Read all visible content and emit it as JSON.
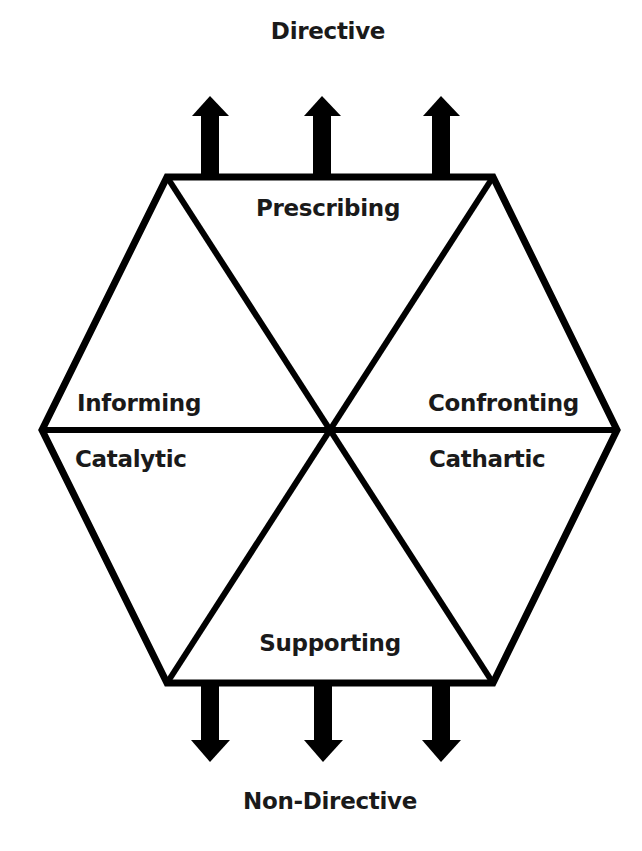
{
  "diagram": {
    "title_top": "Directive",
    "title_bottom": "Non-Directive",
    "segments": [
      {
        "id": "prescribing",
        "label": "Prescribing"
      },
      {
        "id": "informing",
        "label": "Informing"
      },
      {
        "id": "confronting",
        "label": "Confronting"
      },
      {
        "id": "catalytic",
        "label": "Catalytic"
      },
      {
        "id": "cathartic",
        "label": "Cathartic"
      },
      {
        "id": "supporting",
        "label": "Supporting"
      }
    ],
    "arrows_top": {
      "count": 3,
      "direction": "up"
    },
    "arrows_bottom": {
      "count": 3,
      "direction": "down"
    },
    "colors": {
      "stroke": "#000000",
      "text": "#1a1a1a",
      "background": "#ffffff"
    }
  }
}
